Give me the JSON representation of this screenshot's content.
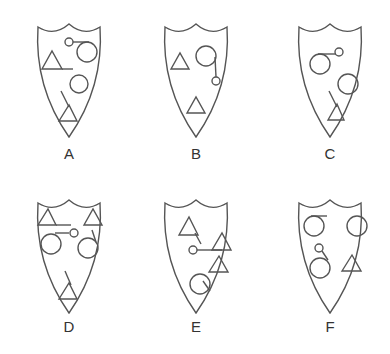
{
  "figure": {
    "stroke_color": "#555555",
    "background": "#ffffff",
    "options": [
      {
        "label": "A"
      },
      {
        "label": "B"
      },
      {
        "label": "C"
      },
      {
        "label": "D"
      },
      {
        "label": "E"
      },
      {
        "label": "F"
      }
    ]
  }
}
